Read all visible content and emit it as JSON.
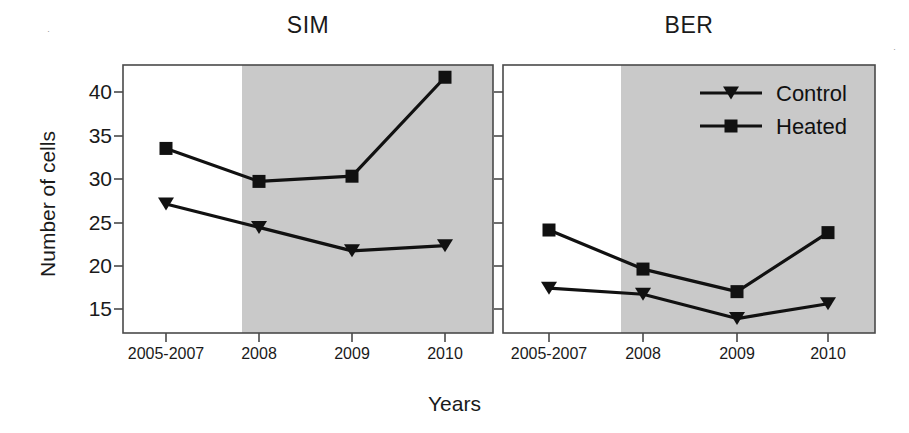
{
  "figure": {
    "width": 909,
    "height": 433,
    "background": "#ffffff",
    "ink_color": "#111111",
    "shaded_region_color": "#c9c9c9",
    "axis_color": "#4a4a4a"
  },
  "axes": {
    "ylabel": "Number of cells",
    "xlabel": "Years",
    "y_ticks": [
      15,
      20,
      25,
      30,
      35,
      40
    ],
    "y_tick_labels": [
      "15",
      "20",
      "25",
      "30",
      "35",
      "40"
    ],
    "ylim": [
      12.5,
      43.5
    ],
    "x_tick_labels": [
      "2005-2007",
      "2008",
      "2009",
      "2010"
    ]
  },
  "legend": {
    "position": "top-right-of-ber-panel",
    "entries": [
      {
        "label": "Control",
        "marker": "triangle-down",
        "color": "#111111"
      },
      {
        "label": "Heated",
        "marker": "square",
        "color": "#111111"
      }
    ]
  },
  "chart_data": [
    {
      "type": "line",
      "title": "SIM",
      "xlabel": "Years",
      "ylabel": "Number of cells",
      "categories": [
        "2005-2007",
        "2008",
        "2009",
        "2010"
      ],
      "ylim": [
        12.5,
        43.5
      ],
      "grid": false,
      "shaded_from_category": "2008",
      "series": [
        {
          "name": "Control",
          "marker": "triangle-down",
          "values": [
            27.1,
            24.4,
            21.7,
            22.3
          ]
        },
        {
          "name": "Heated",
          "marker": "square",
          "values": [
            33.5,
            29.7,
            30.3,
            41.7
          ]
        }
      ]
    },
    {
      "type": "line",
      "title": "BER",
      "xlabel": "Years",
      "ylabel": "Number of cells",
      "categories": [
        "2005-2007",
        "2008",
        "2009",
        "2010"
      ],
      "ylim": [
        12.5,
        43.5
      ],
      "grid": false,
      "shaded_from_category": "2008",
      "series": [
        {
          "name": "Control",
          "marker": "triangle-down",
          "values": [
            17.4,
            16.7,
            13.9,
            15.6
          ]
        },
        {
          "name": "Heated",
          "marker": "square",
          "values": [
            24.1,
            19.6,
            17.0,
            23.8
          ]
        }
      ]
    }
  ]
}
